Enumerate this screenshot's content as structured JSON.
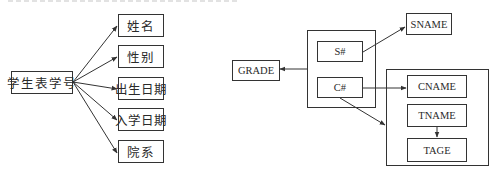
{
  "left_diagram": {
    "source": {
      "label": "学生表学号"
    },
    "targets": [
      {
        "label": "姓名"
      },
      {
        "label": "性别"
      },
      {
        "label": "出生日期"
      },
      {
        "label": "入学日期"
      },
      {
        "label": "院系"
      }
    ]
  },
  "right_diagram": {
    "key_group": {
      "s_key": {
        "label": "S#"
      },
      "c_key": {
        "label": "C#"
      }
    },
    "grade": {
      "label": "GRADE"
    },
    "sname": {
      "label": "SNAME"
    },
    "course_group": {
      "cname": {
        "label": "CNAME"
      },
      "tname": {
        "label": "TNAME"
      },
      "tage": {
        "label": "TAGE"
      }
    }
  },
  "colors": {
    "line": "#333333",
    "background": "#ffffff"
  }
}
